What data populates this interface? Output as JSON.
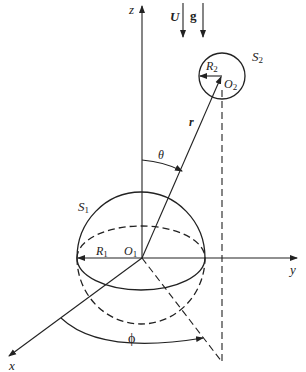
{
  "diagram": {
    "axes": {
      "z": "z",
      "y": "y",
      "x": "x"
    },
    "vectors": {
      "flow": "U",
      "gravity": "g",
      "position": "r"
    },
    "angles": {
      "polar": "θ",
      "azimuth": "ϕ"
    },
    "sphere1": {
      "name": "S",
      "name_sub": "1",
      "center": "O",
      "center_sub": "1",
      "radius": "R",
      "radius_sub": "1"
    },
    "sphere2": {
      "name": "S",
      "name_sub": "2",
      "center": "O",
      "center_sub": "2",
      "radius": "R",
      "radius_sub": "2"
    },
    "colors": {
      "stroke": "#222222",
      "background": "#ffffff"
    }
  }
}
